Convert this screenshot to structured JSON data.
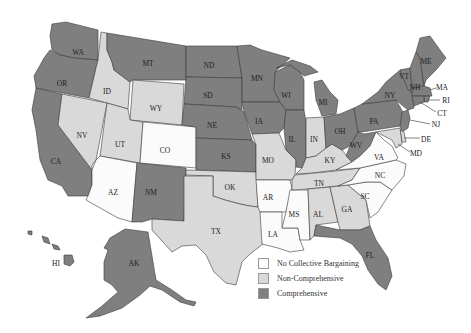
{
  "colors": {
    "none": "#fbfbfb",
    "non": "#d9d9d9",
    "comp": "#7f7f7f"
  },
  "legend": {
    "items": [
      {
        "label": "No Collective Bargaining",
        "category": "none"
      },
      {
        "label": "Non-Comprehensive",
        "category": "non"
      },
      {
        "label": "Comprehensive",
        "category": "comp"
      }
    ]
  },
  "states": {
    "WA": "comp",
    "OR": "comp",
    "CA": "comp",
    "ID": "non",
    "NV": "non",
    "MT": "comp",
    "WY": "non",
    "UT": "non",
    "CO": "none",
    "AZ": "none",
    "NM": "comp",
    "ND": "comp",
    "SD": "comp",
    "NE": "comp",
    "KS": "comp",
    "OK": "non",
    "TX": "non",
    "MN": "comp",
    "IA": "comp",
    "MO": "non",
    "AR": "none",
    "LA": "none",
    "WI": "comp",
    "IL": "comp",
    "MS": "none",
    "MI": "comp",
    "IN": "non",
    "KY": "non",
    "TN": "non",
    "AL": "non",
    "OH": "comp",
    "WV": "comp",
    "GA": "non",
    "FL": "comp",
    "SC": "none",
    "NC": "none",
    "VA": "none",
    "PA": "comp",
    "NY": "comp",
    "VT": "comp",
    "NH": "comp",
    "ME": "comp",
    "MA": "comp",
    "RI": "comp",
    "CT": "comp",
    "NJ": "comp",
    "DE": "non",
    "MD": "non",
    "AK": "comp",
    "HI": "comp"
  },
  "labels": {
    "WA": "WA",
    "OR": "OR",
    "CA": "CA",
    "ID": "ID",
    "NV": "NV",
    "MT": "MT",
    "WY": "WY",
    "UT": "UT",
    "CO": "CO",
    "AZ": "AZ",
    "NM": "NM",
    "ND": "ND",
    "SD": "SD",
    "NE": "NE",
    "KS": "KS",
    "OK": "OK",
    "TX": "TX",
    "MN": "MN",
    "IA": "IA",
    "MO": "MO",
    "AR": "AR",
    "LA": "LA",
    "WI": "WI",
    "IL": "IL",
    "MS": "MS",
    "MI": "MI",
    "IN": "IN",
    "KY": "KY",
    "TN": "TN",
    "AL": "AL",
    "OH": "OH",
    "WV": "WV",
    "GA": "GA",
    "FL": "FL",
    "SC": "SC",
    "NC": "NC",
    "VA": "VA",
    "PA": "PA",
    "NY": "NY",
    "VT": "VT",
    "NH": "NH",
    "ME": "ME",
    "MA": "MA",
    "RI": "RI",
    "CT": "CT",
    "NJ": "NJ",
    "DE": "DE",
    "MD": "MD",
    "AK": "AK",
    "HI": "HI"
  }
}
